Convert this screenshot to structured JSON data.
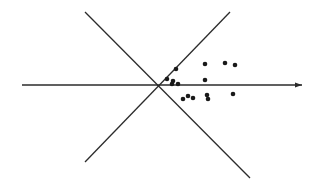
{
  "figure": {
    "title": "",
    "background_color": "#ffffff",
    "width": 315,
    "height": 182
  },
  "chart_data": {
    "type": "scatter",
    "title": "",
    "subtitle": "",
    "xlabel": "",
    "ylabel": "",
    "grid": false,
    "legend": null,
    "axis_style": "single horizontal axis with right-pointing arrowhead",
    "xlim": [
      0,
      315
    ],
    "ylim": [
      182,
      0
    ],
    "marker": {
      "shape": "circle",
      "color": "#1a1a1a",
      "radius_px": 2.3
    },
    "points": [
      {
        "x": 176,
        "y": 69
      },
      {
        "x": 205,
        "y": 64
      },
      {
        "x": 225,
        "y": 63
      },
      {
        "x": 235,
        "y": 65
      },
      {
        "x": 167,
        "y": 79
      },
      {
        "x": 173,
        "y": 81
      },
      {
        "x": 172,
        "y": 84
      },
      {
        "x": 178,
        "y": 84
      },
      {
        "x": 205,
        "y": 80
      },
      {
        "x": 188,
        "y": 96
      },
      {
        "x": 183,
        "y": 99
      },
      {
        "x": 193,
        "y": 98
      },
      {
        "x": 207,
        "y": 95
      },
      {
        "x": 208,
        "y": 99
      },
      {
        "x": 233,
        "y": 94
      }
    ],
    "point_count": 15,
    "lines": [
      {
        "name": "horizontal-axis",
        "x1": 22,
        "y1": 85,
        "x2": 302,
        "y2": 85,
        "color": "#2b2b2b",
        "width": 1.6,
        "arrowhead": "end"
      },
      {
        "name": "descending-diagonal",
        "x1": 85,
        "y1": 12,
        "x2": 250,
        "y2": 178,
        "color": "#2b2b2b",
        "width": 1.3,
        "arrowhead": "none"
      },
      {
        "name": "ascending-diagonal",
        "x1": 85,
        "y1": 162,
        "x2": 230,
        "y2": 12,
        "color": "#2b2b2b",
        "width": 1.3,
        "arrowhead": "none"
      }
    ],
    "intersection": {
      "x": 155,
      "y": 85
    },
    "annotations": []
  }
}
